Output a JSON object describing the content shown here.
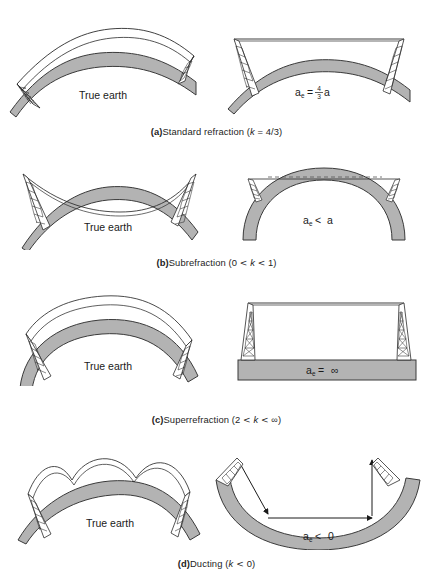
{
  "figure": {
    "header_artifact": "",
    "earth_label": "True earth",
    "panels": [
      {
        "id": "a",
        "caption_prefix": "(a)",
        "caption_text": "Standard refraction (",
        "caption_var": "k",
        "caption_rel": " = ",
        "caption_value": "4/3)",
        "left_label": "True earth",
        "right_label_main": "a",
        "right_label_sub": "e",
        "right_label_rel": "=",
        "right_label_num": "4",
        "right_label_den": "3",
        "right_label_tail": "a"
      },
      {
        "id": "b",
        "caption_prefix": "(b)",
        "caption_text": "Subrefraction (0 ",
        "caption_lt1": "<",
        "caption_var": " k ",
        "caption_lt2": "<",
        "caption_value": " 1)",
        "left_label": "True earth",
        "right_label_main": "a",
        "right_label_sub": "e",
        "right_label_rel": "<",
        "right_label_tail": "a"
      },
      {
        "id": "c",
        "caption_prefix": "(c)",
        "caption_text": "Superrefraction (2 ",
        "caption_lt1": "<",
        "caption_var": " k ",
        "caption_lt2": "<",
        "caption_value": " ∞)",
        "left_label": "True earth",
        "right_label_main": "a",
        "right_label_sub": "e",
        "right_label_rel": "=",
        "right_label_tail": "∞"
      },
      {
        "id": "d",
        "caption_prefix": "(d)",
        "caption_text": "Ducting (",
        "caption_var": "k",
        "caption_lt1": " < ",
        "caption_value": "0)",
        "left_label": "True earth",
        "right_label_main": "a",
        "right_label_sub": "e",
        "right_label_rel": "<",
        "right_label_tail": "0"
      }
    ],
    "colors": {
      "earth_fill": "#b3b3b3",
      "earth_stroke": "#3a3a3a",
      "line": "#2b2b2b",
      "text": "#1a1a1a",
      "background": "#ffffff"
    }
  }
}
